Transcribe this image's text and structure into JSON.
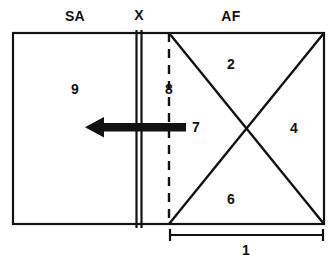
{
  "diagram": {
    "colors": {
      "stroke": "#121212",
      "background": "#ffffff",
      "arrow": "#121212"
    },
    "region_labels": [
      {
        "name": "sa-label",
        "text": "SA",
        "x": 75,
        "y": 16
      },
      {
        "name": "x-label",
        "text": "X",
        "x": 139,
        "y": 15
      },
      {
        "name": "af-label",
        "text": "AF",
        "x": 231,
        "y": 16
      }
    ],
    "number_labels": [
      {
        "name": "number-9",
        "text": "9",
        "x": 75,
        "y": 89
      },
      {
        "name": "number-8",
        "text": "8",
        "x": 169,
        "y": 89
      },
      {
        "name": "number-2",
        "text": "2",
        "x": 231,
        "y": 64
      },
      {
        "name": "number-4",
        "text": "4",
        "x": 294,
        "y": 128
      },
      {
        "name": "number-6",
        "text": "6",
        "x": 231,
        "y": 199
      },
      {
        "name": "number-7",
        "text": "7",
        "x": 196,
        "y": 127
      },
      {
        "name": "number-1",
        "text": "1",
        "x": 246,
        "y": 250
      }
    ],
    "geometry": {
      "outer_box": {
        "x1": 13,
        "y1": 33,
        "x2": 324,
        "y2": 224
      },
      "divider_x_lines": [
        136.5,
        141.5
      ],
      "dashed_line_x": 169,
      "diagonals": [
        {
          "x1": 169,
          "y1": 33,
          "x2": 324,
          "y2": 224
        },
        {
          "x1": 324,
          "y1": 33,
          "x2": 169,
          "y2": 224
        }
      ],
      "crossing_point": {
        "x": 231,
        "y": 132
      },
      "arrow": {
        "tip_x": 85,
        "tail_x": 186,
        "y": 127,
        "shaft_thickness": 8,
        "head_width": 19,
        "head_height": 21
      },
      "dimension_bracket": {
        "x1": 169,
        "x2": 324,
        "y": 235,
        "tick_height": 8
      }
    }
  }
}
